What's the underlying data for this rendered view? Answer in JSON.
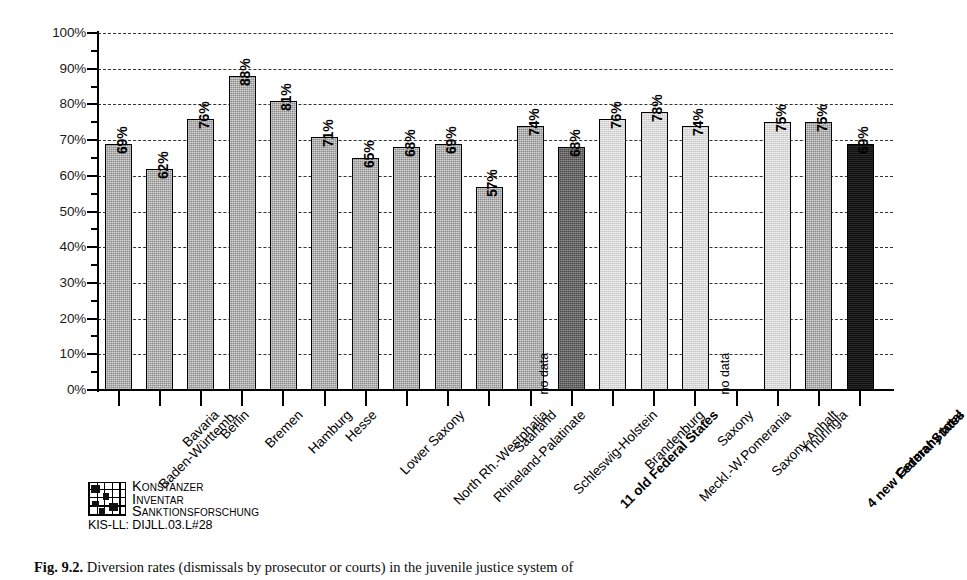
{
  "figure": {
    "caption_label": "Fig. 9.2.",
    "caption_text": "Diversion rates (dismissals by prosecutor or courts) in the juvenile justice system of"
  },
  "logo": {
    "line1": "Konstanzer",
    "line2": "Inventar",
    "line3": "Sanktionsforschung",
    "code": "KIS-LL: DIJLL.03.L#28"
  },
  "axis": {
    "y_tick_labels": [
      "100%",
      "90%",
      "80%",
      "70%",
      "60%",
      "50%",
      "40%",
      "30%",
      "20%",
      "10%",
      "0%"
    ],
    "y_min": 0,
    "y_max": 100,
    "y_step": 10,
    "no_data_label": "no data"
  },
  "colors": {
    "state_fill": "#8c8c8c",
    "old_total_fill": "#4a4a4a",
    "new_state_fill": "#d9d9d9",
    "new_total_fill": "#8c8c8c",
    "germany_total_fill": "#101010",
    "axis": "#000000",
    "grid": "#111111",
    "background": "#ffffff"
  },
  "chart_data": {
    "type": "bar",
    "title": "",
    "xlabel": "",
    "ylabel": "",
    "ylim": [
      0,
      100
    ],
    "ygrid": true,
    "legend": "none",
    "value_suffix": "%",
    "categories": [
      "Baden-Württemb.",
      "Bavaria",
      "Berlin",
      "Bremen",
      "Hamburg",
      "Hesse",
      "Lower Saxony",
      "North Rh.-Westphalia",
      "Rhineland-Palatinate",
      "Saarland",
      "Schleswig-Holstein",
      "11 old Federal States",
      "Brandenburg",
      "Meckl.-W.Pomerania",
      "Saxony",
      "Saxony-Anhalt",
      "Thuringia",
      "4 new Federal States",
      "Germany total"
    ],
    "values": [
      69,
      62,
      76,
      88,
      81,
      71,
      65,
      68,
      69,
      57,
      74,
      68,
      76,
      78,
      74,
      null,
      75,
      75,
      69
    ],
    "value_labels": [
      "69%",
      "62%",
      "76%",
      "88%",
      "81%",
      "71%",
      "65%",
      "68%",
      "69%",
      "57%",
      "74%",
      "68%",
      "76%",
      "78%",
      "74%",
      "no data",
      "75%",
      "75%",
      "69%"
    ],
    "bars": [
      {
        "label": "Baden-Württemb.",
        "value": 69,
        "value_label": "69%",
        "group": "old-state",
        "bold": false,
        "no_data": false
      },
      {
        "label": "Bavaria",
        "value": 62,
        "value_label": "62%",
        "group": "old-state",
        "bold": false,
        "no_data": false
      },
      {
        "label": "Berlin",
        "value": 76,
        "value_label": "76%",
        "group": "old-state",
        "bold": false,
        "no_data": false
      },
      {
        "label": "Bremen",
        "value": 88,
        "value_label": "88%",
        "group": "old-state",
        "bold": false,
        "no_data": false
      },
      {
        "label": "Hamburg",
        "value": 81,
        "value_label": "81%",
        "group": "old-state",
        "bold": false,
        "no_data": false
      },
      {
        "label": "Hesse",
        "value": 71,
        "value_label": "71%",
        "group": "old-state",
        "bold": false,
        "no_data": false
      },
      {
        "label": "Lower Saxony",
        "value": 65,
        "value_label": "65%",
        "group": "old-state",
        "bold": false,
        "no_data": false
      },
      {
        "label": "North Rh.-Westphalia",
        "value": 68,
        "value_label": "68%",
        "group": "old-state",
        "bold": false,
        "no_data": false
      },
      {
        "label": "Rhineland-Palatinate",
        "value": 69,
        "value_label": "69%",
        "group": "old-state",
        "bold": false,
        "no_data": false
      },
      {
        "label": "Saarland",
        "value": 57,
        "value_label": "57%",
        "group": "old-state",
        "bold": false,
        "no_data": false
      },
      {
        "label": "Schleswig-Holstein",
        "value": 74,
        "value_label": "74%",
        "group": "old-state",
        "bold": false,
        "no_data": false
      },
      {
        "label": "11 old Federal States",
        "value": 68,
        "value_label": "68%",
        "group": "old-total",
        "bold": true,
        "no_data": false
      },
      {
        "label": "Brandenburg",
        "value": 76,
        "value_label": "76%",
        "group": "new-state",
        "bold": false,
        "no_data": false
      },
      {
        "label": "Meckl.-W.Pomerania",
        "value": 78,
        "value_label": "78%",
        "group": "new-state",
        "bold": false,
        "no_data": false
      },
      {
        "label": "Saxony",
        "value": 74,
        "value_label": "74%",
        "group": "new-state",
        "bold": false,
        "no_data": false
      },
      {
        "label": "Saxony-Anhalt",
        "value": null,
        "value_label": "no data",
        "group": "new-state",
        "bold": false,
        "no_data": true
      },
      {
        "label": "Thuringia",
        "value": 75,
        "value_label": "75%",
        "group": "new-state",
        "bold": false,
        "no_data": false
      },
      {
        "label": "4 new Federal States",
        "value": 75,
        "value_label": "75%",
        "group": "new-total",
        "bold": true,
        "no_data": false
      },
      {
        "label": "Germany total",
        "value": 69,
        "value_label": "69%",
        "group": "germany",
        "bold": true,
        "no_data": false
      }
    ],
    "notes": [
      {
        "text": "no data",
        "near": "Schleswig-Holstein"
      },
      {
        "text": "no data",
        "near": "Saxony-Anhalt"
      }
    ]
  }
}
